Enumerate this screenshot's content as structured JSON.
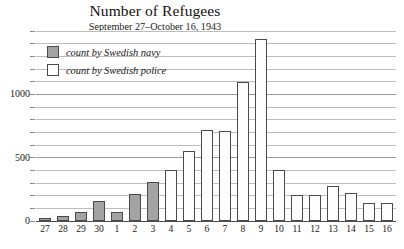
{
  "chart_data": {
    "type": "bar",
    "title": "Number of Refugees",
    "subtitle": "September 27–October 16, 1943",
    "xlabel": "",
    "ylabel": "",
    "ylim": [
      0,
      1500
    ],
    "yticks_labeled": [
      "0",
      "500",
      "1000"
    ],
    "yticks_labeled_values": [
      0,
      500,
      1000
    ],
    "gridline_interval": 100,
    "grid": true,
    "legend_position": "upper-left-inside",
    "categories": [
      "27",
      "28",
      "29",
      "30",
      "1",
      "2",
      "3",
      "4",
      "5",
      "6",
      "7",
      "8",
      "9",
      "10",
      "11",
      "12",
      "13",
      "14",
      "15",
      "16"
    ],
    "series": [
      {
        "name": "count by Swedish navy",
        "color": "#a3a3a3",
        "values": [
          20,
          40,
          75,
          160,
          70,
          215,
          310,
          null,
          null,
          null,
          null,
          null,
          null,
          null,
          null,
          null,
          null,
          null,
          null,
          null
        ]
      },
      {
        "name": "count by Swedish police",
        "color": "#ffffff",
        "values": [
          null,
          null,
          null,
          null,
          null,
          null,
          null,
          400,
          555,
          715,
          710,
          1100,
          1440,
          400,
          205,
          205,
          280,
          225,
          140,
          140
        ]
      }
    ],
    "bars": [
      {
        "category": "27",
        "value": 20,
        "series": "count by Swedish navy"
      },
      {
        "category": "28",
        "value": 40,
        "series": "count by Swedish navy"
      },
      {
        "category": "29",
        "value": 75,
        "series": "count by Swedish navy"
      },
      {
        "category": "30",
        "value": 160,
        "series": "count by Swedish navy"
      },
      {
        "category": "1",
        "value": 70,
        "series": "count by Swedish navy"
      },
      {
        "category": "2",
        "value": 215,
        "series": "count by Swedish navy"
      },
      {
        "category": "3",
        "value": 310,
        "series": "count by Swedish navy"
      },
      {
        "category": "4",
        "value": 400,
        "series": "count by Swedish police"
      },
      {
        "category": "5",
        "value": 555,
        "series": "count by Swedish police"
      },
      {
        "category": "6",
        "value": 715,
        "series": "count by Swedish police"
      },
      {
        "category": "7",
        "value": 710,
        "series": "count by Swedish police"
      },
      {
        "category": "8",
        "value": 1100,
        "series": "count by Swedish police"
      },
      {
        "category": "9",
        "value": 1440,
        "series": "count by Swedish police"
      },
      {
        "category": "10",
        "value": 400,
        "series": "count by Swedish police"
      },
      {
        "category": "11",
        "value": 205,
        "series": "count by Swedish police"
      },
      {
        "category": "12",
        "value": 205,
        "series": "count by Swedish police"
      },
      {
        "category": "13",
        "value": 280,
        "series": "count by Swedish police"
      },
      {
        "category": "14",
        "value": 225,
        "series": "count by Swedish police"
      },
      {
        "category": "15",
        "value": 140,
        "series": "count by Swedish police"
      },
      {
        "category": "16",
        "value": 140,
        "series": "count by Swedish police"
      }
    ]
  },
  "legend": {
    "items": [
      {
        "label": "count by Swedish navy",
        "style": "navy"
      },
      {
        "label": "count by Swedish police",
        "style": "police"
      }
    ]
  },
  "colors": {
    "navy_fill": "#a3a3a3",
    "police_fill": "#ffffff",
    "bar_stroke": "#4a4a4a",
    "gridline": "#9a9a9a",
    "text": "#1a1a1a"
  }
}
